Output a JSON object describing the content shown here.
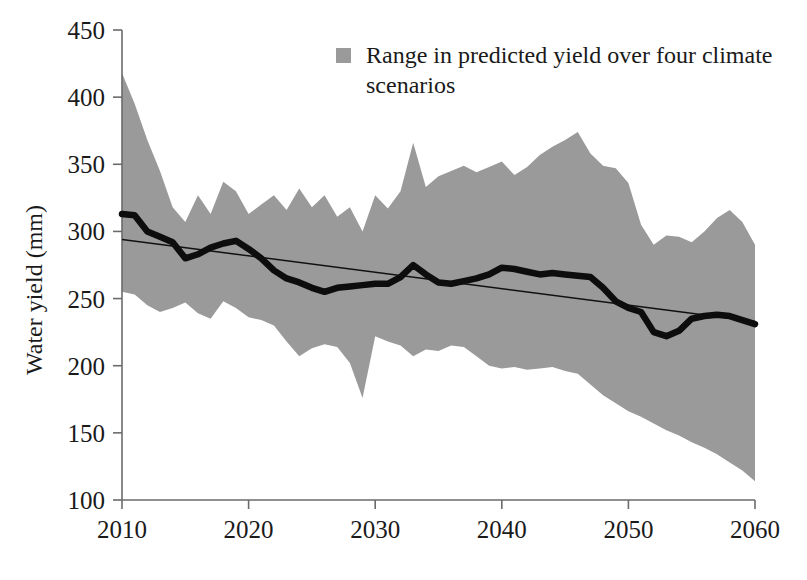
{
  "chart_data": {
    "type": "area",
    "title": "",
    "xlabel": "",
    "ylabel": "Water yield (mm)",
    "xlim": [
      2010,
      2060
    ],
    "ylim": [
      100,
      450
    ],
    "grid": false,
    "legend_position": "top-center",
    "legend": [
      {
        "label": "Range in predicted yield over four climate scenarios",
        "marker": "filled-square",
        "color": "#9a9a9a"
      }
    ],
    "xticks": [
      2010,
      2020,
      2030,
      2040,
      2050,
      2060
    ],
    "xtick_labels": [
      "2010",
      "2020",
      "2030",
      "2040",
      "2050",
      "2060"
    ],
    "yticks": [
      100,
      150,
      200,
      250,
      300,
      350,
      400,
      450
    ],
    "ytick_labels": [
      "100",
      "150",
      "200",
      "250",
      "300",
      "350",
      "400",
      "450"
    ],
    "x": [
      2010,
      2011,
      2012,
      2013,
      2014,
      2015,
      2016,
      2017,
      2018,
      2019,
      2020,
      2021,
      2022,
      2023,
      2024,
      2025,
      2026,
      2027,
      2028,
      2029,
      2030,
      2031,
      2032,
      2033,
      2034,
      2035,
      2036,
      2037,
      2038,
      2039,
      2040,
      2041,
      2042,
      2043,
      2044,
      2045,
      2046,
      2047,
      2048,
      2049,
      2050,
      2051,
      2052,
      2053,
      2054,
      2055,
      2056,
      2057,
      2058,
      2059,
      2060
    ],
    "series": [
      {
        "name": "Range in predicted yield over four climate scenarios (upper bound)",
        "type": "band-upper",
        "color": "#9a9a9a",
        "values": [
          418,
          395,
          368,
          345,
          318,
          307,
          327,
          313,
          337,
          330,
          313,
          320,
          327,
          316,
          332,
          318,
          327,
          311,
          318,
          300,
          327,
          317,
          330,
          366,
          333,
          341,
          345,
          349,
          344,
          348,
          352,
          342,
          348,
          357,
          363,
          368,
          374,
          358,
          349,
          347,
          336,
          305,
          290,
          297,
          296,
          292,
          300,
          310,
          316,
          307,
          290
        ]
      },
      {
        "name": "Range in predicted yield over four climate scenarios (lower bound)",
        "type": "band-lower",
        "color": "#9a9a9a",
        "values": [
          255,
          253,
          245,
          240,
          243,
          247,
          239,
          235,
          248,
          243,
          236,
          234,
          230,
          218,
          207,
          213,
          216,
          214,
          202,
          176,
          222,
          218,
          215,
          207,
          212,
          211,
          215,
          214,
          207,
          200,
          198,
          199,
          197,
          198,
          199,
          196,
          194,
          186,
          178,
          172,
          166,
          162,
          157,
          152,
          148,
          143,
          139,
          134,
          128,
          122,
          114
        ]
      },
      {
        "name": "Mean predicted water yield",
        "type": "line",
        "color": "#0d0d0d",
        "values": [
          313,
          312,
          300,
          296,
          292,
          280,
          283,
          288,
          291,
          293,
          287,
          280,
          271,
          265,
          262,
          258,
          255,
          258,
          259,
          260,
          261,
          261,
          266,
          275,
          268,
          262,
          261,
          263,
          265,
          268,
          273,
          272,
          270,
          268,
          269,
          268,
          267,
          266,
          258,
          248,
          243,
          240,
          225,
          222,
          226,
          235,
          237,
          238,
          237,
          234,
          231
        ]
      },
      {
        "name": "Linear trend",
        "type": "trend",
        "color": "#111111",
        "endpoints": [
          [
            2010,
            294
          ],
          [
            2060,
            233
          ]
        ]
      }
    ]
  },
  "axes": {
    "y_axis_title": "Water yield (mm)"
  }
}
